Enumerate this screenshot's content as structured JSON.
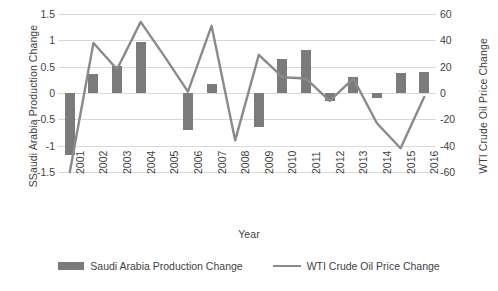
{
  "chart_data": {
    "type": "bar",
    "title": "",
    "xlabel": "Year",
    "ylabel": "SSaudi Arabia Production Change",
    "y2label": "WTI Crude Oil Price Change",
    "categories": [
      "2001",
      "2002",
      "2003",
      "2004",
      "2005",
      "2006",
      "2007",
      "2008",
      "2009",
      "2010",
      "2011",
      "2012",
      "2013",
      "2014",
      "2015",
      "2016"
    ],
    "ylim": [
      -1.5,
      1.5
    ],
    "y2lim": [
      -60,
      60
    ],
    "yticks": [
      "1.5",
      "1",
      "0.5",
      "0",
      "-0.5",
      "-1",
      "-1.5"
    ],
    "ytick_values": [
      1.5,
      1,
      0.5,
      0,
      -0.5,
      -1,
      -1.5
    ],
    "y2ticks": [
      "60",
      "40",
      "20",
      "0",
      "-20",
      "-40",
      "-60"
    ],
    "y2tick_values": [
      60,
      40,
      20,
      0,
      -20,
      -40,
      -60
    ],
    "grid": true,
    "legend_position": "bottom",
    "series": [
      {
        "name": "Saudi Arabia Production Change",
        "type": "bar",
        "axis": "left",
        "color": "#7b7b7b",
        "values": [
          -1.17,
          0.37,
          0.51,
          0.97,
          0.0,
          -0.71,
          0.18,
          0.0,
          -0.65,
          0.64,
          0.81,
          -0.15,
          0.3,
          -0.1,
          0.38,
          0.39
        ]
      },
      {
        "name": "WTI Crude Oil Price Change",
        "type": "line",
        "axis": "right",
        "color": "#8a8a8a",
        "values": [
          -62,
          38,
          18,
          54,
          28,
          1,
          51,
          -36,
          29,
          12,
          11,
          -6,
          11,
          -23,
          -42,
          -3
        ]
      }
    ]
  },
  "axes": {
    "y_left_title": "SSaudi Arabia Production Change",
    "y_right_title": "WTI Crude Oil Price Change",
    "x_title": "Year"
  },
  "legend": {
    "items": [
      {
        "label": "Saudi Arabia Production Change",
        "swatch": "bar-swatch"
      },
      {
        "label": "WTI Crude Oil Price Change",
        "swatch": "line-swatch"
      }
    ]
  }
}
